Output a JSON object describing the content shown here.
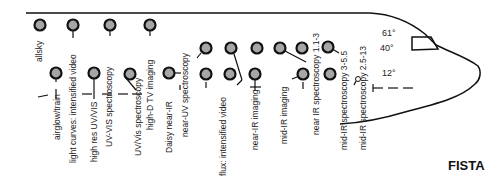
{
  "title": "FISTA",
  "angles": [
    "61°",
    "40°",
    "12°"
  ],
  "instruments": [
    {
      "label": "allsky"
    },
    {
      "label": "airglow/train"
    },
    {
      "label": "light curves: intensified video"
    },
    {
      "label": "high res UV/VIS"
    },
    {
      "label": "UV-VIS spectroscopy"
    },
    {
      "label": "UV/Vis spectroscopy"
    },
    {
      "label": "high-D TV imaging"
    },
    {
      "label": "Daisy near-IR"
    },
    {
      "label": "near-UV spectroscopy"
    },
    {
      "label": "flux: intensified video"
    },
    {
      "label": "near-IR imaging"
    },
    {
      "label": "mid-IR imaging"
    },
    {
      "label": "near IR spectroscopy 1.1-3"
    },
    {
      "label": "mid-IR spectroscopy 3-5.5"
    },
    {
      "label": "mid-IR spectroscopy 2.5-13"
    }
  ]
}
